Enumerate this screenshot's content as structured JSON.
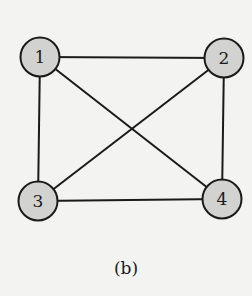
{
  "figure": {
    "caption": "(b)",
    "colors": {
      "background": "#f3f3f1",
      "node_fill": "#d2d2d0",
      "stroke": "#1a1a1a"
    },
    "nodes": [
      {
        "id": "1",
        "label": "1",
        "x": 40,
        "y": 57
      },
      {
        "id": "2",
        "label": "2",
        "x": 224,
        "y": 58
      },
      {
        "id": "3",
        "label": "3",
        "x": 38,
        "y": 201
      },
      {
        "id": "4",
        "label": "4",
        "x": 222,
        "y": 199
      }
    ],
    "edges": [
      {
        "from": "1",
        "to": "2"
      },
      {
        "from": "1",
        "to": "3"
      },
      {
        "from": "1",
        "to": "4"
      },
      {
        "from": "2",
        "to": "3"
      },
      {
        "from": "2",
        "to": "4"
      },
      {
        "from": "3",
        "to": "4"
      }
    ],
    "graph_type": "complete graph K4 (undirected)"
  }
}
